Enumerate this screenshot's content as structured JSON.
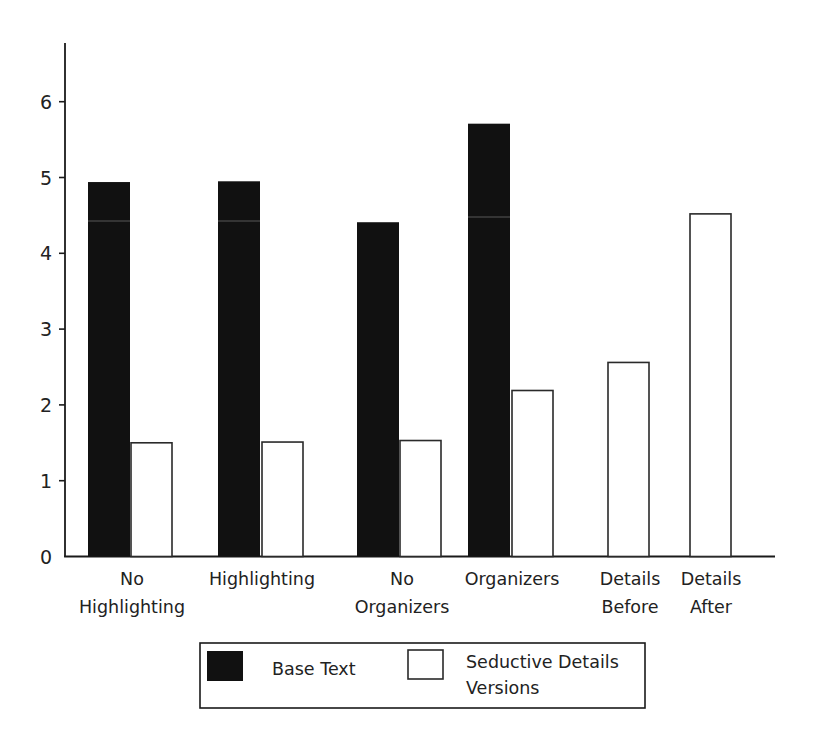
{
  "chart_data": {
    "type": "bar",
    "title": "",
    "xlabel": "",
    "ylabel": "",
    "ylim": [
      0,
      6.8
    ],
    "yticks": [
      0,
      1,
      2,
      3,
      4,
      5,
      6
    ],
    "grid": false,
    "legend_position": "bottom",
    "categories": [
      [
        "No",
        "Highlighting"
      ],
      [
        "Highlighting"
      ],
      [
        "No",
        "Organizers"
      ],
      [
        "Organizers"
      ],
      [
        "Details",
        "Before"
      ],
      [
        "Details",
        "After"
      ]
    ],
    "series": [
      {
        "name": "Base Text",
        "color": "#111111",
        "values": [
          4.94,
          4.95,
          4.41,
          5.71,
          null,
          null
        ]
      },
      {
        "name": "Seductive Details Versions",
        "color": "#ffffff",
        "values": [
          1.5,
          1.51,
          1.53,
          2.19,
          2.56,
          4.52
        ]
      }
    ]
  },
  "legend": {
    "items": [
      {
        "label_lines": [
          "Base Text"
        ],
        "swatch": "filled"
      },
      {
        "label_lines": [
          "Seductive Details",
          "Versions"
        ],
        "swatch": "outline"
      }
    ]
  },
  "colors": {
    "axis": "#1a1a1a",
    "filled_bar": "#111111",
    "outline_bar_stroke": "#2a2a2a",
    "background": "#ffffff"
  }
}
